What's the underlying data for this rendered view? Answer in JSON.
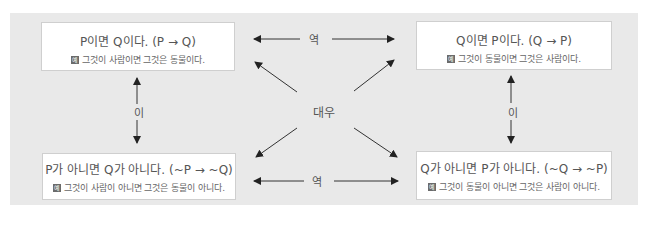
{
  "top_partial_text": "라. 각 대우 관계 …",
  "boxes": {
    "top_left": {
      "title": "P이면 Q이다. (P → Q)",
      "badge": "예",
      "example": "그것이 사람이면 그것은 동물이다."
    },
    "top_right": {
      "title": "Q이면 P이다. (Q → P)",
      "badge": "예",
      "example": "그것이 동물이면 그것은 사람이다."
    },
    "bottom_left": {
      "title": "P가 아니면 Q가 아니다. (~P → ~Q)",
      "badge": "예",
      "example": "그것이 사람이 아니면 그것은 동물이 아니다."
    },
    "bottom_right": {
      "title": "Q가 아니면 P가 아니다. (~Q → ~P)",
      "badge": "예",
      "example": "그것이 동물이 아니면 그것은 사람이 아니다."
    }
  },
  "relations": {
    "top": "역",
    "bottom": "역",
    "left": "이",
    "right": "이",
    "center": "대우"
  },
  "colors": {
    "panel_bg": "#e9e9e9",
    "box_bg": "#ffffff",
    "arrow": "#222222",
    "badge": "#6b6b6b"
  }
}
